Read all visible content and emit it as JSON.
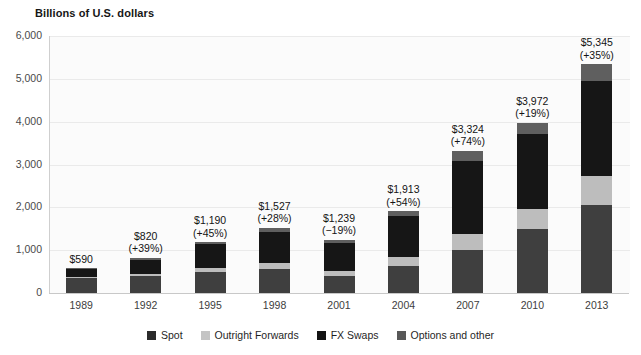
{
  "chart_data": {
    "type": "bar",
    "stacked": true,
    "title": "Billions of U.S. dollars",
    "xlabel": "",
    "ylabel": "Billions of U.S. dollars",
    "ylim": [
      0,
      6000
    ],
    "ytick_labels": [
      "6,000",
      "5,000",
      "4,000",
      "3,000",
      "2,000",
      "1,000",
      "0"
    ],
    "ytick_values": [
      6000,
      5000,
      4000,
      3000,
      2000,
      1000,
      0
    ],
    "grid": true,
    "legend_position": "bottom",
    "categories": [
      "1989",
      "1992",
      "1995",
      "1998",
      "2001",
      "2004",
      "2007",
      "2010",
      "2013"
    ],
    "series": [
      {
        "name": "Spot",
        "color": "#3f3f3f",
        "values": [
          350,
          394,
          494,
          568,
          386,
          631,
          1005,
          1488,
          2046
        ]
      },
      {
        "name": "Outright Forwards",
        "color": "#bdbdbd",
        "values": [
          27,
          58,
          97,
          128,
          130,
          209,
          362,
          475,
          680
        ]
      },
      {
        "name": "FX Swaps",
        "color": "#161616",
        "values": [
          190,
          324,
          546,
          734,
          656,
          954,
          1714,
          1759,
          2228
        ]
      },
      {
        "name": "Options and other",
        "color": "#5f5f5f",
        "values": [
          23,
          44,
          53,
          97,
          67,
          119,
          243,
          250,
          391
        ]
      }
    ],
    "totals": [
      590,
      820,
      1190,
      1527,
      1239,
      1913,
      3324,
      3972,
      5345
    ],
    "bar_labels": [
      {
        "amount": "$590",
        "change": ""
      },
      {
        "amount": "$820",
        "change": "(+39%)"
      },
      {
        "amount": "$1,190",
        "change": "(+45%)"
      },
      {
        "amount": "$1,527",
        "change": "(+28%)"
      },
      {
        "amount": "$1,239",
        "change": "(−19%)"
      },
      {
        "amount": "$1,913",
        "change": "(+54%)"
      },
      {
        "amount": "$3,324",
        "change": "(+74%)"
      },
      {
        "amount": "$3,972",
        "change": "(+19%)"
      },
      {
        "amount": "$5,345",
        "change": "(+35%)"
      }
    ]
  },
  "legend": {
    "items": [
      {
        "label": "Spot",
        "color": "#2b2b2b"
      },
      {
        "label": "Outright Forwards",
        "color": "#c4c4c4"
      },
      {
        "label": "FX Swaps",
        "color": "#131313"
      },
      {
        "label": "Options and other",
        "color": "#585858"
      }
    ]
  },
  "colors": {
    "plot_background": "#fbfbfb",
    "gridline": "#eaeaea",
    "axis": "#c8c8c8",
    "text": "#1c1c1c"
  }
}
